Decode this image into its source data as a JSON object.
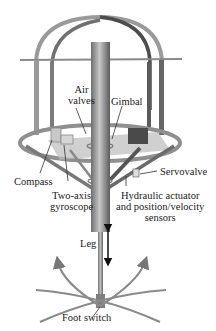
{
  "diagram": {
    "labels": {
      "air_valves_line1": "Air",
      "air_valves_line2": "valves",
      "gimbal": "Gimbal",
      "compass": "Compass",
      "servovalve": "Servovalve",
      "gyroscope_line1": "Two-axis",
      "gyroscope_line2": "gyroscope",
      "hydraulic_line1": "Hydraulic actuator",
      "hydraulic_line2": "and position/velocity",
      "hydraulic_line3": "sensors",
      "leg": "Leg",
      "foot_switch": "Foot switch"
    },
    "colors": {
      "frame_light": "#9a9a9a",
      "frame_dark": "#555555",
      "leg": "#8c8c8c",
      "text": "#222222",
      "arrow": "#777777"
    }
  }
}
